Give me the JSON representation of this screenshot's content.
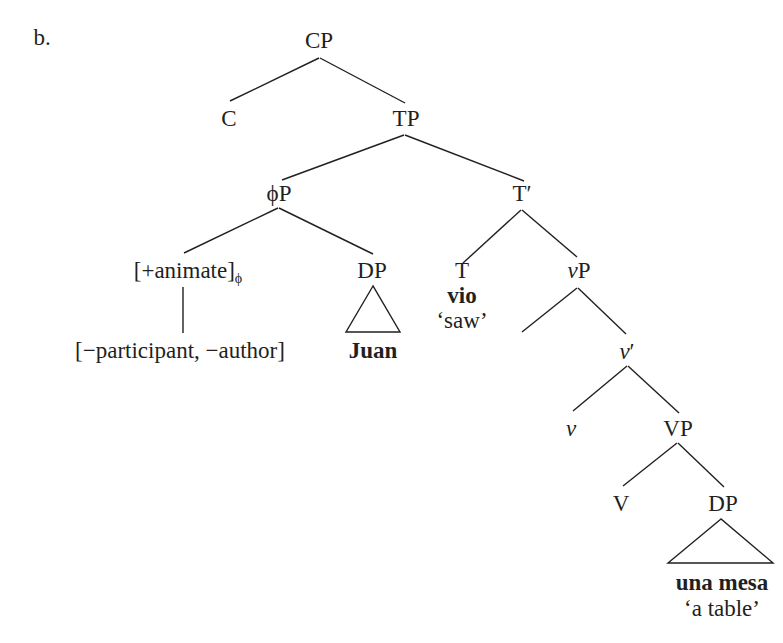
{
  "example_label": "b.",
  "tree": {
    "root": "CP",
    "nodes": {
      "cp": "CP",
      "c": "C",
      "tp": "TP",
      "phip": "ϕP",
      "tbar": "T′",
      "animate": "[+animate]",
      "animate_sub": "ϕ",
      "dp_subject": "DP",
      "features": "[−participant, −author]",
      "juan": "Juan",
      "t": "T",
      "vio": "vio",
      "vio_gloss": "‘saw’",
      "vp_little_v": "v",
      "vp_little_P": "P",
      "vbar_v": "v",
      "vbar_prime": "′",
      "little_v": "v",
      "vp": "VP",
      "big_v": "V",
      "dp_object": "DP",
      "una_mesa": "una mesa",
      "una_mesa_gloss": "‘a table’"
    },
    "structure": "[CP C [TP [ϕP [+animate]ϕ [−participant, −author]] [DP Juan]] [T′ [T vio 'saw'] [vP _ [v′ v [VP V [DP una mesa 'a table']]]]]]]"
  }
}
